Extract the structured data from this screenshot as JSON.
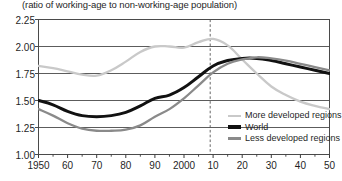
{
  "axis_note": "(ratio of working-age to non-working-age population)",
  "legend": {
    "items": [
      {
        "label": "More developed regions",
        "color": "#c9c9c9",
        "name": "more-developed-regions"
      },
      {
        "label": "World",
        "color": "#111111",
        "name": "world"
      },
      {
        "label": "Less developed regions",
        "color": "#8a8a8a",
        "name": "less-developed-regions"
      }
    ]
  },
  "chart_data": {
    "type": "line",
    "title": "",
    "subtitle": "",
    "xlabel": "",
    "ylabel": "(ratio of working-age to non-working-age population)",
    "xlim": [
      1950,
      2050
    ],
    "ylim": [
      1.0,
      2.25
    ],
    "ytick_values": [
      1.0,
      1.25,
      1.5,
      1.75,
      2.0,
      2.25
    ],
    "ytick_labels": [
      "1.00",
      "1.25",
      "1.50",
      "1.75",
      "2.00",
      "2.25"
    ],
    "xtick_values": [
      1950,
      1960,
      1970,
      1980,
      1990,
      2000,
      2010,
      2020,
      2030,
      2040,
      2050
    ],
    "xtick_labels": [
      "1950",
      "60",
      "70",
      "80",
      "90",
      "2000",
      "10",
      "20",
      "30",
      "40",
      "50"
    ],
    "minor_xticks_every": 5,
    "grid": "horizontal",
    "legend_position": "lower-right-inside",
    "annotations": [
      {
        "type": "vline",
        "x": 2009,
        "style": "dashed",
        "color": "#555555",
        "label": ""
      }
    ],
    "x": [
      1950,
      1955,
      1960,
      1965,
      1970,
      1975,
      1980,
      1985,
      1990,
      1995,
      2000,
      2005,
      2010,
      2015,
      2020,
      2025,
      2030,
      2035,
      2040,
      2045,
      2050
    ],
    "series": [
      {
        "name": "More developed regions",
        "color": "#c9c9c9",
        "values": [
          1.82,
          1.8,
          1.77,
          1.74,
          1.73,
          1.78,
          1.86,
          1.95,
          2.0,
          2.0,
          1.99,
          2.04,
          2.07,
          2.01,
          1.88,
          1.75,
          1.63,
          1.55,
          1.49,
          1.45,
          1.42
        ]
      },
      {
        "name": "World",
        "color": "#111111",
        "values": [
          1.5,
          1.46,
          1.4,
          1.36,
          1.35,
          1.36,
          1.39,
          1.45,
          1.52,
          1.55,
          1.62,
          1.72,
          1.82,
          1.87,
          1.89,
          1.89,
          1.87,
          1.84,
          1.81,
          1.78,
          1.75
        ]
      },
      {
        "name": "Less developed regions",
        "color": "#8a8a8a",
        "values": [
          1.42,
          1.36,
          1.29,
          1.24,
          1.22,
          1.22,
          1.23,
          1.27,
          1.35,
          1.42,
          1.52,
          1.64,
          1.76,
          1.84,
          1.88,
          1.9,
          1.89,
          1.87,
          1.84,
          1.81,
          1.78
        ]
      }
    ]
  }
}
